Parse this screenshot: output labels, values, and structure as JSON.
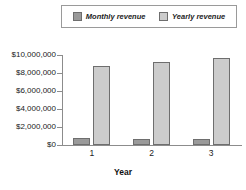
{
  "chart_data": {
    "type": "bar",
    "title": "",
    "xlabel": "Year",
    "ylabel": "",
    "categories": [
      "1",
      "2",
      "3"
    ],
    "series": [
      {
        "name": "Monthly revenue",
        "color": "#9a9a9a",
        "values": [
          750000,
          680000,
          680000
        ]
      },
      {
        "name": "Yearly revenue",
        "color": "#cccccc",
        "values": [
          8800000,
          9200000,
          9700000
        ]
      }
    ],
    "ylim": [
      0,
      10000000
    ],
    "ytick_values": [
      0,
      2000000,
      4000000,
      6000000,
      8000000,
      10000000
    ],
    "ytick_labels": [
      "$0",
      "$2,000,000",
      "$4,000,000",
      "$6,000,000",
      "$8,000,000",
      "$10,000,000"
    ],
    "grid": false,
    "legend_position": "top"
  },
  "legend": {
    "entries": [
      {
        "label": "Monthly revenue",
        "swatch": "legend-swatch-monthly"
      },
      {
        "label": "Yearly revenue",
        "swatch": "legend-swatch-yearly"
      }
    ]
  }
}
